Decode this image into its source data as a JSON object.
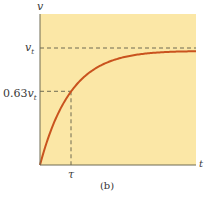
{
  "chart_data": {
    "type": "line",
    "title": "",
    "caption": "(b)",
    "xlabel": "t",
    "ylabel": "v",
    "colors": {
      "background": "#fbe7a6",
      "curve": "#c9531e",
      "axes": "#6e6a52",
      "dashed": "#6e6a52"
    },
    "series": [
      {
        "name": "v(t) = v_t (1 - e^(-t/τ))",
        "x": [
          0,
          0.25,
          0.5,
          0.75,
          1,
          1.5,
          2,
          2.5,
          3,
          3.5,
          4,
          4.5,
          5
        ],
        "values": [
          0,
          0.22,
          0.39,
          0.53,
          0.63,
          0.78,
          0.86,
          0.92,
          0.95,
          0.97,
          0.98,
          0.99,
          0.99
        ]
      }
    ],
    "reference_lines": [
      {
        "axis": "y",
        "value": 1.0,
        "label": "v_t",
        "style": "dashed"
      },
      {
        "axis": "y",
        "value": 0.63,
        "label": "0.63v_t",
        "style": "dashed"
      },
      {
        "axis": "x",
        "value": 1.0,
        "label": "τ",
        "style": "dashed"
      }
    ],
    "y_tick_labels": [
      "v_t",
      "0.63v_t"
    ],
    "x_tick_labels": [
      "τ"
    ],
    "xlim": [
      0,
      5
    ],
    "ylim": [
      0,
      1.3
    ],
    "grid": false,
    "legend": "none"
  },
  "labels": {
    "v_axis": "v",
    "t_axis": "t",
    "vt_main": "v",
    "vt_sub": "t",
    "vt63_prefix": "0.63",
    "vt63_main": "v",
    "vt63_sub": "t",
    "tau": "τ",
    "caption": "(b)"
  }
}
